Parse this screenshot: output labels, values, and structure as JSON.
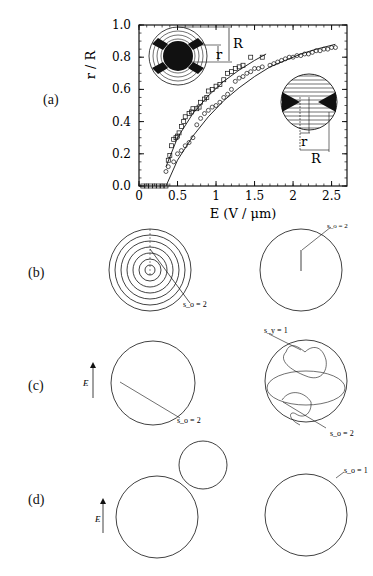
{
  "figure": {
    "panels": [
      {
        "id": "a",
        "label": "(a)"
      },
      {
        "id": "b",
        "label": "(b)"
      },
      {
        "id": "c",
        "label": "(c)"
      },
      {
        "id": "d",
        "label": "(d)"
      }
    ],
    "annotations": {
      "b_left": "s_o = 2",
      "b_right": "s_o = 2",
      "c_left": "s_o = 2",
      "c_right_top": "s_y = 1",
      "c_right_bottom": "s_o = 2",
      "d_right": "s_o = 1",
      "field_label": "E",
      "inset_R": "R",
      "inset_r": "r"
    },
    "caption": "Figure caption (truncated, not legible)"
  },
  "chart_data": {
    "type": "scatter",
    "title": "",
    "xlabel": "E (V / μm)",
    "ylabel": "r / R",
    "xlim": [
      0,
      2.7
    ],
    "ylim": [
      0,
      1.0
    ],
    "xticks": [
      "0",
      "0.5",
      "1",
      "1.5",
      "2",
      "2.5"
    ],
    "yticks": [
      "0.0",
      "0.2",
      "0.4",
      "0.6",
      "0.8",
      "1.0"
    ],
    "grid": false,
    "legend": "none (insets illustrate geometry)",
    "series": [
      {
        "name": "squares",
        "marker": "square",
        "x": [
          0.05,
          0.1,
          0.15,
          0.2,
          0.25,
          0.3,
          0.35,
          0.38,
          0.4,
          0.42,
          0.45,
          0.48,
          0.5,
          0.52,
          0.55,
          0.58,
          0.6,
          0.65,
          0.68,
          0.7,
          0.75,
          0.78,
          0.8,
          0.85,
          0.88,
          0.9,
          0.95,
          1.0,
          1.05,
          1.1,
          1.15,
          1.2,
          1.25,
          1.3,
          1.35,
          1.45,
          1.6
        ],
        "y": [
          0.0,
          0.0,
          0.0,
          0.0,
          0.0,
          0.0,
          0.0,
          0.16,
          0.19,
          0.25,
          0.29,
          0.3,
          0.31,
          0.33,
          0.37,
          0.4,
          0.43,
          0.45,
          0.46,
          0.48,
          0.48,
          0.49,
          0.52,
          0.54,
          0.55,
          0.59,
          0.6,
          0.62,
          0.63,
          0.66,
          0.7,
          0.71,
          0.73,
          0.74,
          0.75,
          0.8,
          0.8
        ]
      },
      {
        "name": "circles",
        "marker": "circle",
        "x": [
          0.35,
          0.38,
          0.45,
          0.5,
          0.55,
          0.6,
          0.65,
          0.7,
          0.75,
          0.8,
          0.85,
          0.9,
          0.95,
          1.0,
          1.05,
          1.1,
          1.15,
          1.2,
          1.25,
          1.3,
          1.35,
          1.4,
          1.45,
          1.5,
          1.55,
          1.6,
          1.7,
          1.75,
          1.8,
          1.85,
          1.9,
          1.95,
          2.0,
          2.05,
          2.1,
          2.15,
          2.2,
          2.25,
          2.3,
          2.35,
          2.4,
          2.45,
          2.5,
          2.55
        ],
        "y": [
          0.09,
          0.12,
          0.15,
          0.2,
          0.22,
          0.25,
          0.27,
          0.3,
          0.38,
          0.42,
          0.45,
          0.47,
          0.49,
          0.5,
          0.52,
          0.55,
          0.57,
          0.6,
          0.65,
          0.67,
          0.68,
          0.7,
          0.71,
          0.73,
          0.73,
          0.74,
          0.75,
          0.76,
          0.77,
          0.78,
          0.79,
          0.8,
          0.8,
          0.81,
          0.81,
          0.82,
          0.82,
          0.83,
          0.84,
          0.84,
          0.85,
          0.85,
          0.86,
          0.86
        ]
      }
    ],
    "fit_curves": [
      {
        "name": "fit-squares",
        "x": [
          0.35,
          0.5,
          0.7,
          0.9,
          1.1,
          1.3,
          1.5,
          1.65
        ],
        "y": [
          0.12,
          0.3,
          0.45,
          0.56,
          0.65,
          0.72,
          0.78,
          0.82
        ]
      },
      {
        "name": "fit-circles",
        "x": [
          0.35,
          0.5,
          0.7,
          0.9,
          1.1,
          1.3,
          1.5,
          1.7,
          1.9,
          2.1,
          2.3,
          2.55
        ],
        "y": [
          0.0,
          0.16,
          0.31,
          0.43,
          0.53,
          0.61,
          0.68,
          0.74,
          0.78,
          0.82,
          0.85,
          0.88
        ]
      }
    ]
  }
}
